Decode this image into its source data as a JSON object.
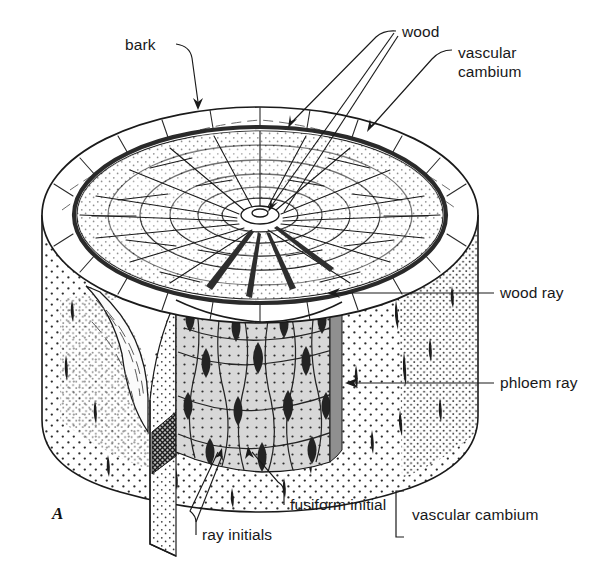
{
  "figure": {
    "panel_label": "A",
    "background_color": "#ffffff",
    "ink_color": "#1a1a1a",
    "cambium_fill": "#d8d8d8",
    "ray_initial_color": "#2b2b2b"
  },
  "labels": {
    "bark": "bark",
    "wood": "wood",
    "vascular_cambium_top": "vascular\ncambium",
    "vascular_cambium_line1": "vascular",
    "vascular_cambium_line2": "cambium",
    "wood_ray": "wood ray",
    "phloem_ray": "phloem ray",
    "fusiform_initial": "fusiform initial",
    "ray_initials": "ray initials",
    "vascular_cambium_bracket": "vascular cambium"
  },
  "structures": [
    {
      "name": "bark",
      "description": "outer stippled layer of the cylinder"
    },
    {
      "name": "vascular-cambium",
      "description": "thin dark ring between bark and wood"
    },
    {
      "name": "wood",
      "description": "inner xylem with concentric growth rings"
    },
    {
      "name": "wood-ray",
      "description": "radial dark wedge inside wood"
    },
    {
      "name": "phloem-ray",
      "description": "short dark dash in bark"
    },
    {
      "name": "fusiform-initial",
      "description": "elongated cambium cell"
    },
    {
      "name": "ray-initial",
      "description": "dark lens-shaped cambium cell"
    }
  ]
}
